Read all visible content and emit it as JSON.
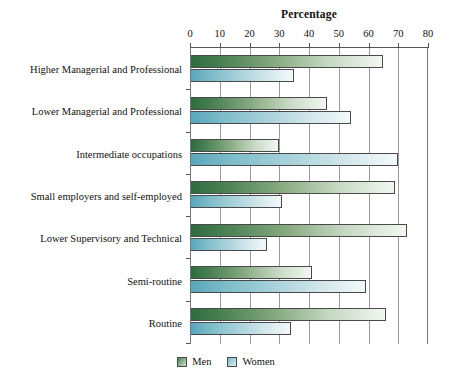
{
  "chart_data": {
    "type": "bar",
    "orientation": "horizontal",
    "title": "Percentage",
    "xlabel": "",
    "ylabel": "",
    "xlim": [
      0,
      80
    ],
    "xticks": [
      0,
      10,
      20,
      30,
      40,
      50,
      60,
      70,
      80
    ],
    "grid": true,
    "legend_position": "bottom-center",
    "categories": [
      "Higher Managerial and Professional",
      "Lower Managerial and Professional",
      "Intermediate occupations",
      "Small employers and self-employed",
      "Lower Supervisory and Technical",
      "Semi-routine",
      "Routine"
    ],
    "series": [
      {
        "name": "Men",
        "color": "#3d7a4e",
        "values": [
          65,
          46,
          30,
          69,
          73,
          41,
          66
        ]
      },
      {
        "name": "Women",
        "color": "#7ab8c8",
        "values": [
          35,
          54,
          70,
          31,
          26,
          59,
          34
        ]
      }
    ]
  },
  "legend": {
    "items": [
      {
        "label": "Men",
        "swatch": "men-color-swatch"
      },
      {
        "label": "Women",
        "swatch": "women-color-swatch"
      }
    ]
  }
}
